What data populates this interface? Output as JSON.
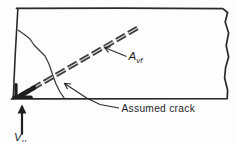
{
  "diagram": {
    "labels": {
      "reinforcement": {
        "base": "A",
        "sub": "vf"
      },
      "shear_force": {
        "base": "V",
        "sub": "u"
      },
      "crack": "Assumed crack"
    },
    "colors": {
      "line": "#2a2a2a",
      "crack": "#3a3a3a",
      "bar": "#3c3c3c",
      "bar_core": "#d9d9d9",
      "background": "#fdfdfd"
    }
  }
}
